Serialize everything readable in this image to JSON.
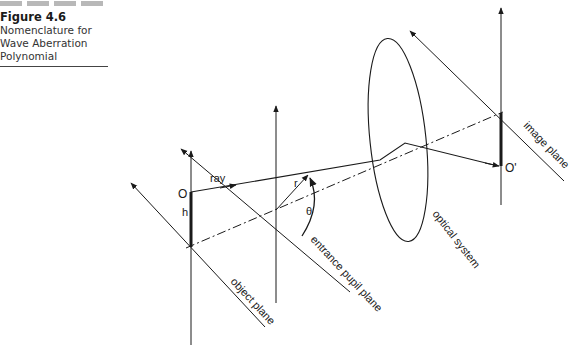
{
  "caption": {
    "figure_label": "Figure 4.6",
    "line1": "Nomenclature for",
    "line2": "Wave Aberration",
    "line3": "Polynomial"
  },
  "diagram": {
    "labels": {
      "object_point": "O",
      "object_height": "h",
      "ray": "ray",
      "pupil_radius": "r",
      "pupil_angle": "θ",
      "image_point": "O'",
      "object_plane": "object plane",
      "entrance_pupil_plane": "entrance pupil plane",
      "optical_system": "optical system",
      "image_plane": "image plane"
    },
    "colors": {
      "line": "#1a1a1a",
      "caption_bar": "#b8b8b8"
    }
  }
}
